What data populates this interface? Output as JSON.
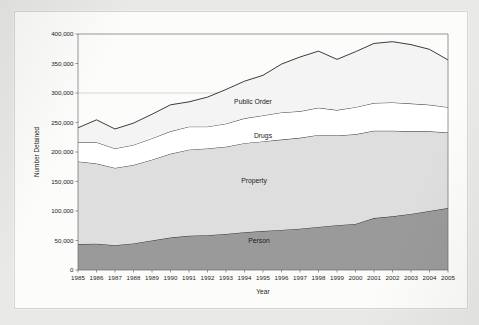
{
  "chart_data": {
    "type": "area",
    "stacked": true,
    "title": "",
    "xlabel": "Year",
    "ylabel": "Number Detained",
    "x": [
      1985,
      1986,
      1987,
      1988,
      1989,
      1990,
      1991,
      1992,
      1993,
      1994,
      1995,
      1996,
      1997,
      1998,
      1999,
      2000,
      2001,
      2002,
      2003,
      2004,
      2005
    ],
    "xtick_labels": [
      "1985",
      "1986",
      "1987",
      "1988",
      "1989",
      "1990",
      "1991",
      "1992",
      "1993",
      "1994",
      "1995",
      "1996",
      "1997",
      "1998",
      "1999",
      "2000",
      "2001",
      "2002",
      "2003",
      "2004",
      "2005"
    ],
    "ylim": [
      0,
      400000
    ],
    "ytick_labels": [
      "0",
      "50,000",
      "100,000",
      "150,000",
      "200,000",
      "250,000",
      "300,000",
      "350,000",
      "400,000"
    ],
    "yticks": [
      0,
      50000,
      100000,
      150000,
      200000,
      250000,
      300000,
      350000,
      400000
    ],
    "grid": "horizontal-at-300000",
    "legend_position": "inline-labels",
    "series": [
      {
        "name": "Person",
        "color": "#9a9a9a",
        "values": [
          44000,
          44500,
          42000,
          45000,
          50000,
          55000,
          58000,
          59000,
          61000,
          64000,
          66000,
          68000,
          70000,
          73000,
          76000,
          78000,
          88000,
          91000,
          95000,
          100000,
          105000
        ]
      },
      {
        "name": "Property",
        "color": "#dedede",
        "values": [
          140000,
          136000,
          131000,
          133000,
          137000,
          142000,
          146000,
          147000,
          148000,
          151000,
          152000,
          153000,
          154000,
          156000,
          152000,
          152000,
          148000,
          145000,
          140000,
          135000,
          128000
        ]
      },
      {
        "name": "Drugs",
        "color": "#ffffff",
        "values": [
          32000,
          36000,
          33000,
          34000,
          36000,
          38000,
          39000,
          37000,
          39000,
          42000,
          44000,
          46000,
          45000,
          46000,
          43000,
          46000,
          47000,
          48000,
          47000,
          45000,
          43000
        ]
      },
      {
        "name": "Public Order",
        "color": "#f4f4f4",
        "values": [
          25000,
          38000,
          33000,
          37000,
          41000,
          45000,
          42000,
          50000,
          58000,
          63000,
          68000,
          82000,
          92000,
          96000,
          86000,
          94000,
          101000,
          103000,
          100000,
          94000,
          80000
        ]
      }
    ],
    "totals": [
      241000,
      254500,
      239000,
      249000,
      264000,
      280000,
      285000,
      293000,
      306000,
      320000,
      330000,
      349000,
      361000,
      371000,
      357000,
      370000,
      384000,
      387000,
      382000,
      374000,
      356000
    ],
    "series_labels": [
      {
        "name": "Public Order",
        "x_px": 252,
        "y_px": 103
      },
      {
        "name": "Drugs",
        "x_px": 262,
        "y_px": 137
      },
      {
        "name": "Property",
        "x_px": 253,
        "y_px": 182
      },
      {
        "name": "Person",
        "x_px": 258,
        "y_px": 242
      }
    ]
  }
}
